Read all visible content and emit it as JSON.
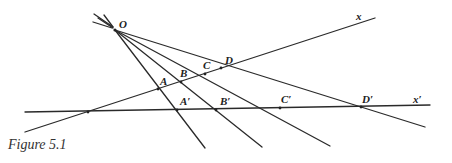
{
  "figure": {
    "caption": "Figure 5.1",
    "labels": {
      "O": "O",
      "x": "x",
      "x_prime": "x′",
      "A": "A",
      "B": "B",
      "C": "C",
      "D": "D",
      "A_prime": "A′",
      "B_prime": "B′",
      "C_prime": "C′",
      "D_prime": "D′"
    },
    "points": {
      "O": [
        115,
        30
      ],
      "vertex": [
        88,
        112
      ],
      "A": [
        158,
        89
      ],
      "B": [
        181,
        82
      ],
      "C": [
        205,
        73
      ],
      "D": [
        220,
        67
      ],
      "A_prime": [
        177,
        110
      ],
      "B_prime": [
        216,
        110
      ],
      "C_prime": [
        280,
        108
      ],
      "D_prime": [
        361,
        107
      ]
    }
  }
}
